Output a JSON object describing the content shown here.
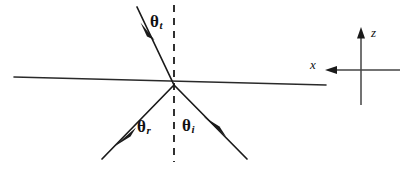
{
  "figure": {
    "background_color": "#ffffff",
    "line_color": "#1a1a1a",
    "width": 408,
    "height": 171
  },
  "labels": {
    "theta_t": {
      "symbol": "θ",
      "subscript": "t",
      "meaning": "transmitted-angle"
    },
    "theta_r": {
      "symbol": "θ",
      "subscript": "r",
      "meaning": "reflected-angle"
    },
    "theta_i": {
      "symbol": "θ",
      "subscript": "i",
      "meaning": "incident-angle"
    }
  },
  "axes": {
    "z_label": "z",
    "x_label": "x",
    "z_direction": "up",
    "x_direction": "left"
  },
  "geometry": {
    "origin": {
      "x": 174,
      "y": 85
    },
    "interface": {
      "x1": 14,
      "y1": 77,
      "x2": 326,
      "y2": 85
    },
    "normal_dashed": {
      "x": 174,
      "y1": 5,
      "y2": 162
    },
    "ray_transmitted": {
      "x1": 174,
      "y1": 85,
      "x2": 137,
      "y2": 7
    },
    "ray_reflected": {
      "x1": 174,
      "y1": 85,
      "x2": 102,
      "y2": 159
    },
    "ray_incident": {
      "x1": 247,
      "y1": 159,
      "x2": 174,
      "y2": 85
    },
    "axis_z": {
      "x": 361,
      "y1": 105,
      "y2": 30
    },
    "axis_x": {
      "y": 70,
      "x1": 400,
      "x2": 320
    }
  }
}
